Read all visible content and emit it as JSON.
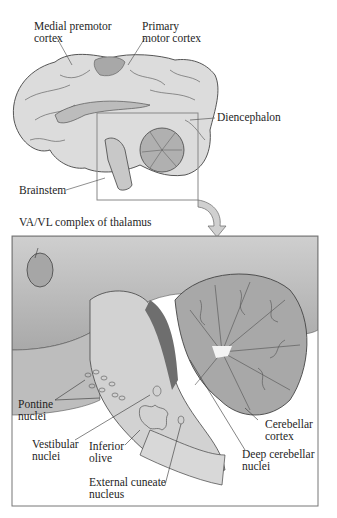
{
  "figure": {
    "top_view": {
      "labels": {
        "medial_premotor": "Medial premotor\ncortex",
        "primary_motor": "Primary\nmotor cortex",
        "diencephalon": "Diencephalon",
        "brainstem": "Brainstem"
      }
    },
    "detail_view": {
      "labels": {
        "vavl": "VA/VL complex of thalamus",
        "pontine": "Pontine\nnuclei",
        "vestibular": "Vestibular\nnuclei",
        "inferior_olive": "Inferior\nolive",
        "external_cuneate": "External cuneate\nnucleus",
        "cerebellar_cortex": "Cerebellar\ncortex",
        "deep_cerebellar": "Deep cerebellar\nnuclei"
      }
    },
    "colors": {
      "tissue_light": "#d9d9d9",
      "tissue_mid": "#b8b8b8",
      "tissue_dark": "#8a8a8a",
      "outline": "#444444",
      "box": "#888888",
      "background": "#ffffff"
    }
  }
}
